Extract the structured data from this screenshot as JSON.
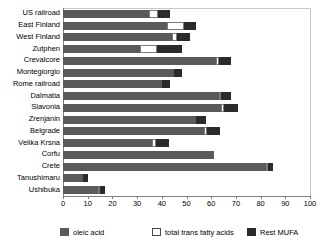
{
  "chart_data": {
    "type": "bar",
    "orientation": "horizontal",
    "stacked": true,
    "title": "",
    "xlabel": "",
    "ylabel": "",
    "xlim": [
      0,
      100
    ],
    "xticks": [
      0,
      10,
      20,
      30,
      40,
      50,
      60,
      70,
      80,
      90,
      100
    ],
    "grid": false,
    "legend_position": "bottom",
    "categories": [
      "US railroad",
      "East Finland",
      "West Finland",
      "Zutphen",
      "Crevalcore",
      "Montegiorgio",
      "Rome railroad",
      "Dalmatia",
      "Slavonia",
      "Zrenjanin",
      "Belgrade",
      "Velika Krsna",
      "Corfu",
      "Crete",
      "Tanushimaru",
      "Ushibuka"
    ],
    "series": [
      {
        "name": "oleic acid",
        "color": "#5a5a5a",
        "values": [
          35.0,
          42.0,
          44.0,
          31.0,
          62.0,
          45.0,
          40.0,
          63.0,
          64.0,
          54.0,
          57.0,
          36.0,
          61.0,
          82.0,
          8.0,
          14.0
        ]
      },
      {
        "name": "total trans fatty acids",
        "color": "#ffffff",
        "values": [
          3.5,
          7.0,
          2.0,
          7.0,
          1.0,
          0.0,
          0.0,
          1.0,
          1.0,
          0.0,
          1.5,
          1.5,
          0.0,
          1.0,
          0.0,
          1.0
        ]
      },
      {
        "name": "Rest MUFA",
        "color": "#2b2b2b",
        "values": [
          5.0,
          5.0,
          5.5,
          10.0,
          5.0,
          3.0,
          3.5,
          4.0,
          6.0,
          4.0,
          5.0,
          5.5,
          0.0,
          2.0,
          2.0,
          2.0
        ]
      }
    ],
    "legend": [
      {
        "label": "oleic acid",
        "swatch": "oleic"
      },
      {
        "label": "total trans fatty acids",
        "swatch": "trans"
      },
      {
        "label": "Rest MUFA",
        "swatch": "rest"
      }
    ]
  },
  "colors": {
    "oleic": "#5a5a5a",
    "trans": "#ffffff",
    "rest": "#2b2b2b",
    "axis": "#808080",
    "background": "#ffffff"
  }
}
